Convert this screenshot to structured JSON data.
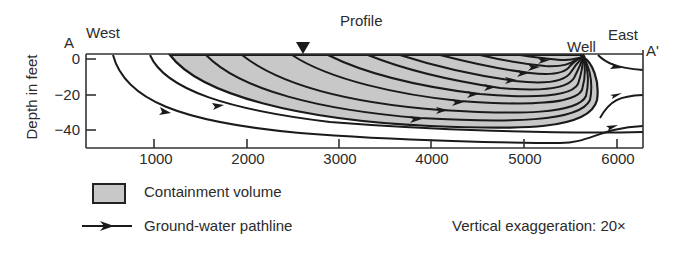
{
  "title": "Profile",
  "labels": {
    "west": "West",
    "east": "East",
    "section_start": "A",
    "section_end": "A'",
    "well": "Well"
  },
  "axes": {
    "ylabel": "Depth in feet",
    "y_ticks": [
      "0",
      "−20",
      "−40"
    ],
    "x_ticks": [
      "1000",
      "2000",
      "3000",
      "4000",
      "5000",
      "6000"
    ]
  },
  "legend": {
    "containment": "Containment volume",
    "pathline": "Ground-water pathline"
  },
  "note": "Vertical exaggeration: 20×",
  "colors": {
    "containment_fill": "#c8c8c8",
    "line": "#1a1a1a"
  },
  "markers": {
    "water_table": "water-table-triangle"
  }
}
